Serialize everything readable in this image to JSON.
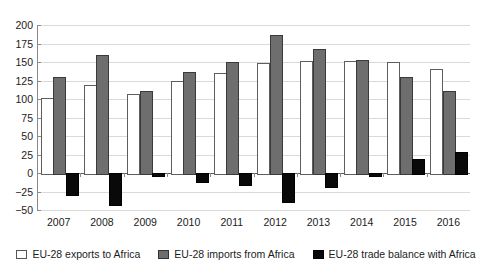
{
  "chart_data": {
    "type": "bar",
    "title": "",
    "subtitle": "",
    "xlabel": "",
    "ylabel": "",
    "categories": [
      "2007",
      "2008",
      "2009",
      "2010",
      "2011",
      "2012",
      "2013",
      "2014",
      "2015",
      "2016"
    ],
    "series": [
      {
        "name": "EU-28 exports to Africa",
        "key": "exports",
        "color": "#ffffff",
        "values": [
          102,
          119,
          107,
          125,
          135,
          148,
          151,
          151,
          150,
          141
        ]
      },
      {
        "name": "EU-28 imports from Africa",
        "key": "imports",
        "color": "#6e6e6e",
        "values": [
          130,
          160,
          111,
          136,
          150,
          186,
          167,
          153,
          130,
          111
        ]
      },
      {
        "name": "EU-28 trade balance with Africa",
        "key": "balance",
        "color": "#090909",
        "values": [
          -28,
          -42,
          -3,
          -11,
          -15,
          -38,
          -17,
          -3,
          19,
          29
        ]
      }
    ],
    "ylim": [
      -50,
      200
    ],
    "ytick_values": [
      200,
      175,
      150,
      125,
      100,
      75,
      50,
      25,
      0,
      -25,
      -50
    ],
    "ytick_labels": [
      "200",
      "175",
      "150",
      "125",
      "100",
      "75",
      "50",
      "25",
      "0",
      "−25",
      "−50"
    ],
    "grid": true,
    "legend_position": "bottom"
  },
  "legend": {
    "items": [
      {
        "label": "EU-28 exports to Africa",
        "swatch": "exports-swatch"
      },
      {
        "label": "EU-28 imports from Africa",
        "swatch": "imports-swatch"
      },
      {
        "label": "EU-28 trade balance with Africa",
        "swatch": "balance-swatch"
      }
    ]
  }
}
